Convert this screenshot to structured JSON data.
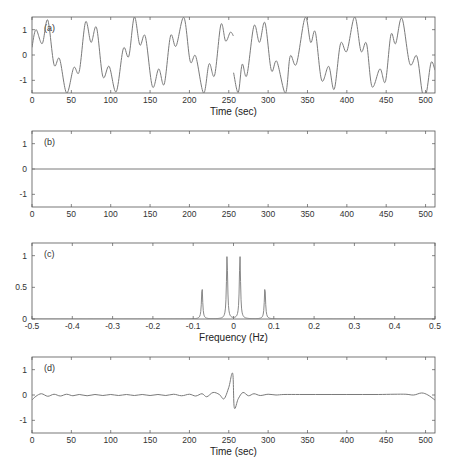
{
  "chart_data": [
    {
      "id": "a",
      "type": "line",
      "panel_label": "(a)",
      "xlabel": "Time (sec)",
      "ylabel": "",
      "xlim": [
        0,
        512
      ],
      "ylim": [
        -1.5,
        1.5
      ],
      "xticks": [
        0,
        50,
        100,
        150,
        200,
        250,
        300,
        350,
        400,
        450,
        500
      ],
      "yticks": [
        -1,
        0,
        1
      ],
      "xtick_labels": [
        "0",
        "50",
        "100",
        "150",
        "200",
        "250",
        "300",
        "350",
        "400",
        "450",
        "500"
      ],
      "ytick_labels": [
        "-1",
        "0",
        "1"
      ],
      "description": "sum of two sinusoids (periods ~64 s and ~13 s) with a discontinuity at t=256 s",
      "series": [
        {
          "name": "signal",
          "x": [
            0,
            5,
            13,
            20,
            28,
            35,
            44,
            53,
            60,
            68,
            75,
            82,
            90,
            98,
            107,
            116,
            123,
            130,
            137,
            144,
            153,
            161,
            168,
            176,
            183,
            193,
            201,
            208,
            218,
            225,
            232,
            240,
            246,
            252,
            255.9,
            256.1,
            262,
            267,
            273,
            282,
            289,
            296,
            304,
            311,
            322,
            328,
            336,
            347,
            354,
            360,
            368,
            377,
            384,
            392,
            400,
            410,
            418,
            425,
            432,
            442,
            449,
            456,
            462,
            470,
            480,
            489,
            496,
            501,
            507,
            512
          ],
          "y": [
            0.3,
            1.0,
            0.45,
            1.38,
            -0.38,
            -0.15,
            -1.5,
            -0.5,
            -0.65,
            1.3,
            0.5,
            1.08,
            -0.85,
            -0.45,
            -1.45,
            0.25,
            -0.05,
            1.5,
            0.4,
            0.73,
            -1.25,
            -0.55,
            -1.15,
            0.75,
            0.35,
            1.48,
            -0.25,
            -0.05,
            -1.5,
            -0.35,
            -0.8,
            1.2,
            0.55,
            0.9,
            0.75,
            -0.7,
            -1.48,
            -0.37,
            -0.8,
            1.15,
            0.5,
            1.27,
            -0.6,
            -0.25,
            -1.5,
            -0.05,
            -0.35,
            1.48,
            0.5,
            0.9,
            -1.0,
            -0.45,
            -1.35,
            0.45,
            0.15,
            1.5,
            0.15,
            0.45,
            -1.25,
            -0.55,
            -1.05,
            0.8,
            0.45,
            1.45,
            -0.35,
            -0.05,
            -1.5,
            -1.5,
            -0.3,
            -0.6
          ]
        }
      ]
    },
    {
      "id": "b",
      "type": "line",
      "panel_label": "(b)",
      "xlabel": "",
      "ylabel": "",
      "xlim": [
        0,
        512
      ],
      "ylim": [
        -1.5,
        1.5
      ],
      "xticks": [
        0,
        50,
        100,
        150,
        200,
        250,
        300,
        350,
        400,
        450,
        500
      ],
      "yticks": [
        -1,
        0,
        1
      ],
      "xtick_labels": [
        "0",
        "50",
        "100",
        "150",
        "200",
        "250",
        "300",
        "350",
        "400",
        "450",
        "500"
      ],
      "ytick_labels": [
        "-1",
        "0",
        "1"
      ],
      "series": [
        {
          "name": "signal",
          "x": [
            0,
            512
          ],
          "y": [
            0,
            0
          ]
        }
      ]
    },
    {
      "id": "c",
      "type": "line",
      "panel_label": "(c)",
      "xlabel": "Frequency (Hz)",
      "ylabel": "",
      "xlim": [
        -0.5,
        0.5
      ],
      "ylim": [
        0,
        1.2
      ],
      "xticks": [
        -0.5,
        -0.4,
        -0.3,
        -0.2,
        -0.1,
        0,
        0.1,
        0.2,
        0.3,
        0.4,
        0.5
      ],
      "yticks": [
        0,
        0.5,
        1
      ],
      "xtick_labels": [
        "-0.5",
        "-0.4",
        "-0.3",
        "-0.2",
        "-0.1",
        "0",
        "0.1",
        "0.2",
        "0.3",
        "0.4",
        "0.5"
      ],
      "ytick_labels": [
        "0",
        "0.5",
        "1"
      ],
      "series": [
        {
          "name": "spectrum",
          "style": "solid",
          "peaks": [
            {
              "f": -0.078,
              "amplitude": 0.5
            },
            {
              "f": -0.016,
              "amplitude": 1.0
            },
            {
              "f": 0.016,
              "amplitude": 1.0
            },
            {
              "f": 0.078,
              "amplitude": 0.5
            }
          ]
        },
        {
          "name": "filter",
          "style": "dashed",
          "x": [
            -0.04,
            -0.04,
            0.04,
            0.04
          ],
          "y": [
            0,
            1.0,
            1.0,
            0
          ]
        }
      ]
    },
    {
      "id": "d",
      "type": "line",
      "panel_label": "(d)",
      "xlabel": "Time (sec)",
      "ylabel": "",
      "xlim": [
        0,
        512
      ],
      "ylim": [
        -1.5,
        1.5
      ],
      "xticks": [
        0,
        50,
        100,
        150,
        200,
        250,
        300,
        350,
        400,
        450,
        500
      ],
      "yticks": [
        -1,
        0,
        1
      ],
      "xtick_labels": [
        "0",
        "50",
        "100",
        "150",
        "200",
        "250",
        "300",
        "350",
        "400",
        "450",
        "500"
      ],
      "ytick_labels": [
        "-1",
        "0",
        "1"
      ],
      "series": [
        {
          "name": "filtered",
          "x": [
            0,
            5,
            12,
            20,
            28,
            36,
            44,
            52,
            60,
            70,
            80,
            90,
            100,
            110,
            120,
            130,
            140,
            150,
            160,
            170,
            180,
            190,
            200,
            208,
            216,
            222,
            230,
            238,
            244,
            250,
            255,
            257,
            262,
            268,
            275,
            282,
            290,
            300,
            310,
            320,
            340,
            360,
            380,
            400,
            420,
            440,
            460,
            475,
            485,
            495,
            503,
            512
          ],
          "y": [
            -0.2,
            -0.05,
            0.05,
            -0.05,
            0.03,
            -0.04,
            0.03,
            -0.03,
            0.02,
            -0.03,
            0.02,
            -0.02,
            0.02,
            -0.02,
            0.02,
            -0.02,
            0.02,
            -0.02,
            0.02,
            -0.02,
            0.03,
            -0.03,
            0.03,
            -0.04,
            0.05,
            -0.07,
            0.1,
            0.02,
            -0.15,
            0.3,
            0.85,
            -0.5,
            -0.15,
            0.1,
            -0.03,
            0.05,
            -0.02,
            0.03,
            0.0,
            0.02,
            0.02,
            0.02,
            0.02,
            0.02,
            0.02,
            0.02,
            0.03,
            0.03,
            0.0,
            0.08,
            0.0,
            -0.2
          ]
        }
      ]
    }
  ]
}
